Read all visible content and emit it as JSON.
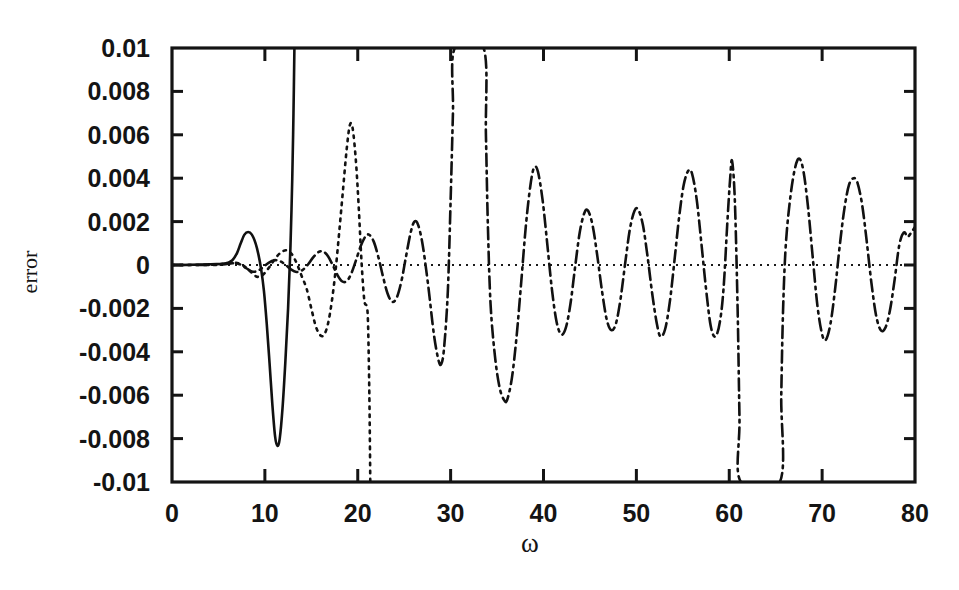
{
  "figure": {
    "background_color": "#ffffff",
    "ink_color": "#141414"
  },
  "chart_data": {
    "type": "line",
    "title": "",
    "subtitle": "",
    "xlabel": "ω",
    "ylabel": "error",
    "xlim": [
      0,
      80
    ],
    "ylim": [
      -0.01,
      0.01
    ],
    "grid": false,
    "legend": "none",
    "x_ticks": [
      0,
      10,
      20,
      30,
      40,
      50,
      60,
      70,
      80
    ],
    "x_tick_labels": [
      "0",
      "10",
      "20",
      "30",
      "40",
      "50",
      "60",
      "70",
      "80"
    ],
    "y_ticks": [
      -0.01,
      -0.008,
      -0.006,
      -0.004,
      -0.002,
      0,
      0.002,
      0.004,
      0.006,
      0.008,
      0.01
    ],
    "y_tick_labels": [
      "-0.01",
      "-0.008",
      "-0.006",
      "-0.004",
      "-0.002",
      "0",
      "0.002",
      "0.004",
      "0.006",
      "0.008",
      "0.01"
    ],
    "annotations": [
      {
        "text": "zero reference line",
        "style": "dotted-horizontal",
        "y": 0
      }
    ],
    "series": [
      {
        "name": "solid",
        "style": "solid",
        "comment": "flat near zero, small positive bump, deep negative dip, then diverges off top of frame near omega=13",
        "points": [
          [
            0.0,
            0.0
          ],
          [
            1.0,
            0.0
          ],
          [
            2.0,
            1e-05
          ],
          [
            3.0,
            2e-05
          ],
          [
            4.0,
            3e-05
          ],
          [
            4.8,
            4e-05
          ],
          [
            5.5,
            6e-05
          ],
          [
            6.0,
            0.0001
          ],
          [
            6.5,
            0.00022
          ],
          [
            7.0,
            0.00055
          ],
          [
            7.4,
            0.001
          ],
          [
            7.8,
            0.0014
          ],
          [
            8.2,
            0.00152
          ],
          [
            8.6,
            0.0014
          ],
          [
            9.0,
            0.001
          ],
          [
            9.3,
            0.0005
          ],
          [
            9.6,
            -0.0002
          ],
          [
            9.9,
            -0.0012
          ],
          [
            10.2,
            -0.0027
          ],
          [
            10.5,
            -0.0045
          ],
          [
            10.8,
            -0.0064
          ],
          [
            11.1,
            -0.0079
          ],
          [
            11.35,
            -0.00833
          ],
          [
            11.6,
            -0.008
          ],
          [
            11.9,
            -0.0066
          ],
          [
            12.2,
            -0.0045
          ],
          [
            12.5,
            -0.002
          ],
          [
            12.75,
            0.0008
          ],
          [
            12.95,
            0.004
          ],
          [
            13.08,
            0.007
          ],
          [
            13.18,
            0.01
          ]
        ]
      },
      {
        "name": "dotted",
        "style": "dotted",
        "comment": "small ripples near zero from omega=5, grows, peak ~0.0065 at omega=19, then dives below -0.01 near omega=21.3",
        "points": [
          [
            0.0,
            0.0
          ],
          [
            2.0,
            0.0
          ],
          [
            4.0,
            1e-05
          ],
          [
            5.0,
            3e-05
          ],
          [
            6.0,
            8e-05
          ],
          [
            6.8,
            0.0001
          ],
          [
            7.5,
            2e-05
          ],
          [
            8.2,
            -0.0002
          ],
          [
            8.8,
            -0.00045
          ],
          [
            9.3,
            -0.00055
          ],
          [
            9.8,
            -0.00045
          ],
          [
            10.3,
            -0.0002
          ],
          [
            10.8,
            0.0001
          ],
          [
            11.3,
            0.0004
          ],
          [
            11.8,
            0.0006
          ],
          [
            12.3,
            0.00068
          ],
          [
            12.8,
            0.00055
          ],
          [
            13.2,
            0.00028
          ],
          [
            13.6,
            -0.0001
          ],
          [
            14.0,
            -0.00055
          ],
          [
            14.5,
            -0.0011
          ],
          [
            15.0,
            -0.002
          ],
          [
            15.5,
            -0.00285
          ],
          [
            16.0,
            -0.00325
          ],
          [
            16.4,
            -0.0032
          ],
          [
            16.8,
            -0.0027
          ],
          [
            17.2,
            -0.0017
          ],
          [
            17.6,
            -0.0003
          ],
          [
            18.0,
            0.0015
          ],
          [
            18.4,
            0.0034
          ],
          [
            18.8,
            0.0053
          ],
          [
            19.15,
            0.00645
          ],
          [
            19.45,
            0.0063
          ],
          [
            19.8,
            0.0048
          ],
          [
            20.1,
            0.0027
          ],
          [
            20.4,
            0.0002
          ],
          [
            20.7,
            -0.0016
          ],
          [
            20.95,
            -0.0019
          ],
          [
            21.1,
            -0.0026
          ],
          [
            21.25,
            -0.006
          ],
          [
            21.35,
            -0.01
          ]
        ]
      },
      {
        "name": "dash-dot",
        "style": "dashdot",
        "comment": "near-zero ripple then sustained oscillation with slowly growing envelope; diverges off top near omega=30 and omega=34, off bottom near omega=60.5 and re-enters at omega=65.5",
        "points": [
          [
            0.0,
            0.0
          ],
          [
            4.0,
            0.0
          ],
          [
            5.5,
            2e-05
          ],
          [
            6.5,
            8e-05
          ],
          [
            7.2,
            5e-05
          ],
          [
            8.0,
            -0.00015
          ],
          [
            8.6,
            -0.0003
          ],
          [
            9.2,
            -0.00028
          ],
          [
            9.8,
            -0.0001
          ],
          [
            10.4,
            0.0001
          ],
          [
            11.0,
            0.00022
          ],
          [
            11.6,
            0.00018
          ],
          [
            12.2,
            2e-05
          ],
          [
            12.8,
            -0.0002
          ],
          [
            13.4,
            -0.00032
          ],
          [
            14.0,
            -0.00025
          ],
          [
            14.6,
            0.0
          ],
          [
            15.2,
            0.00035
          ],
          [
            15.8,
            0.0006
          ],
          [
            16.3,
            0.00062
          ],
          [
            16.8,
            0.0004
          ],
          [
            17.3,
            0.0
          ],
          [
            17.8,
            -0.00045
          ],
          [
            18.3,
            -0.00075
          ],
          [
            18.8,
            -0.00075
          ],
          [
            19.3,
            -0.0004
          ],
          [
            19.8,
            0.0002
          ],
          [
            20.3,
            0.00085
          ],
          [
            20.8,
            0.0013
          ],
          [
            21.2,
            0.0014
          ],
          [
            21.7,
            0.0011
          ],
          [
            22.2,
            0.0004
          ],
          [
            22.7,
            -0.0005
          ],
          [
            23.2,
            -0.0013
          ],
          [
            23.7,
            -0.0017
          ],
          [
            24.2,
            -0.0015
          ],
          [
            24.7,
            -0.00075
          ],
          [
            25.2,
            0.0004
          ],
          [
            25.7,
            0.0015
          ],
          [
            26.1,
            0.002
          ],
          [
            26.5,
            0.00185
          ],
          [
            27.0,
            0.0009
          ],
          [
            27.6,
            -0.001
          ],
          [
            28.2,
            -0.0032
          ],
          [
            28.7,
            -0.0044
          ],
          [
            29.0,
            -0.00455
          ],
          [
            29.3,
            -0.0038
          ],
          [
            29.7,
            -0.0012
          ],
          [
            30.0,
            0.003
          ],
          [
            30.25,
            0.007
          ],
          [
            30.45,
            0.01
          ],
          [
            33.55,
            0.01
          ],
          [
            33.8,
            0.006
          ],
          [
            34.0,
            0.002
          ],
          [
            34.3,
            -0.0018
          ],
          [
            34.8,
            -0.0043
          ],
          [
            35.3,
            -0.0057
          ],
          [
            35.8,
            -0.00625
          ],
          [
            36.1,
            -0.0062
          ],
          [
            36.6,
            -0.0052
          ],
          [
            37.1,
            -0.0033
          ],
          [
            37.6,
            -0.0008
          ],
          [
            38.1,
            0.0018
          ],
          [
            38.6,
            0.0037
          ],
          [
            39.0,
            0.0045
          ],
          [
            39.4,
            0.0043
          ],
          [
            39.9,
            0.003
          ],
          [
            40.4,
            0.001
          ],
          [
            40.9,
            -0.0011
          ],
          [
            41.4,
            -0.0026
          ],
          [
            41.9,
            -0.0032
          ],
          [
            42.4,
            -0.0029
          ],
          [
            42.9,
            -0.0018
          ],
          [
            43.4,
            -0.0001
          ],
          [
            43.9,
            0.0015
          ],
          [
            44.4,
            0.0024
          ],
          [
            44.8,
            0.0025
          ],
          [
            45.3,
            0.0018
          ],
          [
            45.8,
            0.0004
          ],
          [
            46.3,
            -0.0012
          ],
          [
            46.8,
            -0.0025
          ],
          [
            47.3,
            -0.003
          ],
          [
            47.8,
            -0.0027
          ],
          [
            48.3,
            -0.00155
          ],
          [
            48.8,
            0.0001
          ],
          [
            49.3,
            0.00165
          ],
          [
            49.8,
            0.0025
          ],
          [
            50.2,
            0.00255
          ],
          [
            50.7,
            0.00185
          ],
          [
            51.2,
            0.0004
          ],
          [
            51.7,
            -0.0013
          ],
          [
            52.2,
            -0.0027
          ],
          [
            52.6,
            -0.0033
          ],
          [
            53.1,
            -0.00295
          ],
          [
            53.6,
            -0.0017
          ],
          [
            54.1,
            0.0002
          ],
          [
            54.6,
            0.0022
          ],
          [
            55.1,
            0.0037
          ],
          [
            55.6,
            0.00435
          ],
          [
            56.0,
            0.0042
          ],
          [
            56.5,
            0.003
          ],
          [
            57.0,
            0.001
          ],
          [
            57.5,
            -0.0011
          ],
          [
            58.0,
            -0.0028
          ],
          [
            58.5,
            -0.0033
          ],
          [
            59.0,
            -0.0026
          ],
          [
            59.4,
            -0.001
          ],
          [
            59.8,
            0.002
          ],
          [
            60.1,
            0.004
          ],
          [
            60.3,
            0.0048
          ],
          [
            60.6,
            0.003
          ],
          [
            60.9,
            -0.002
          ],
          [
            61.1,
            -0.007
          ],
          [
            61.25,
            -0.01
          ],
          [
            65.45,
            -0.01
          ],
          [
            65.6,
            -0.006
          ],
          [
            65.8,
            -0.002
          ],
          [
            66.1,
            0.001
          ],
          [
            66.6,
            0.0032
          ],
          [
            67.1,
            0.0045
          ],
          [
            67.55,
            0.0049
          ],
          [
            68.0,
            0.0043
          ],
          [
            68.5,
            0.0026
          ],
          [
            69.0,
            0.0003
          ],
          [
            69.5,
            -0.0019
          ],
          [
            70.0,
            -0.0032
          ],
          [
            70.4,
            -0.00345
          ],
          [
            70.9,
            -0.0027
          ],
          [
            71.4,
            -0.0011
          ],
          [
            71.9,
            0.0009
          ],
          [
            72.4,
            0.0026
          ],
          [
            72.9,
            0.0037
          ],
          [
            73.4,
            0.004
          ],
          [
            73.8,
            0.0038
          ],
          [
            74.3,
            0.0028
          ],
          [
            74.8,
            0.0011
          ],
          [
            75.3,
            -0.0008
          ],
          [
            75.8,
            -0.0023
          ],
          [
            76.3,
            -0.003
          ],
          [
            76.8,
            -0.0029
          ],
          [
            77.3,
            -0.0021
          ],
          [
            77.8,
            -0.0007
          ],
          [
            78.3,
            0.0009
          ],
          [
            78.8,
            0.0015
          ],
          [
            79.2,
            0.0013
          ],
          [
            79.6,
            0.0015
          ],
          [
            80.0,
            0.00175
          ]
        ]
      }
    ]
  }
}
